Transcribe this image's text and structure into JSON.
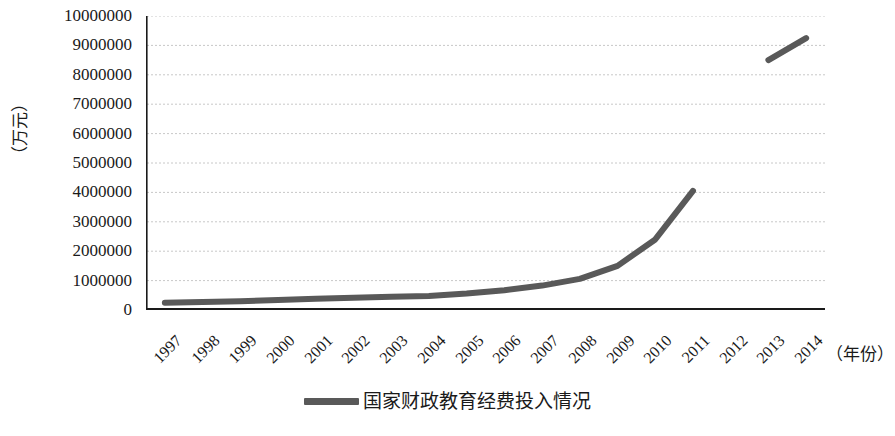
{
  "chart_data": {
    "type": "line",
    "title": "",
    "xlabel": "（年份）",
    "ylabel": "（万元）",
    "ylim": [
      0,
      10000000
    ],
    "ytick_step": 1000000,
    "ytick_labels": [
      "10000000",
      "9000000",
      "8000000",
      "7000000",
      "6000000",
      "5000000",
      "4000000",
      "3000000",
      "2000000",
      "1000000",
      "0"
    ],
    "grid": true,
    "legend_position": "bottom-center",
    "categories": [
      "1997",
      "1998",
      "1999",
      "2000",
      "2001",
      "2002",
      "2003",
      "2004",
      "2005",
      "2006",
      "2007",
      "2008",
      "2009",
      "2010",
      "2011",
      "2012",
      "2013",
      "2014"
    ],
    "series": [
      {
        "name": "国家财政教育经费投入情况",
        "color": "#595959",
        "values": [
          250000,
          270000,
          300000,
          340000,
          380000,
          420000,
          450000,
          480000,
          560000,
          670000,
          830000,
          1060000,
          1500000,
          2400000,
          4050000,
          null,
          8500000,
          9250000
        ]
      }
    ],
    "annotations": {
      "break_note": "数据在2011年与2013年之间断开"
    }
  },
  "legend": {
    "entries": [
      {
        "label": "国家财政教育经费投入情况",
        "color": "#595959"
      }
    ]
  },
  "axes": {
    "y_title": "（万元）",
    "x_title": "（年份）"
  }
}
